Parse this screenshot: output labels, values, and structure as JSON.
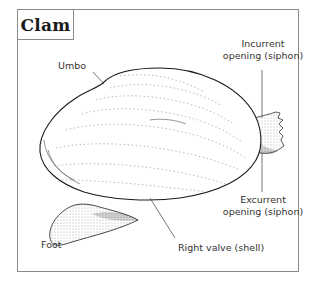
{
  "title": "Clam",
  "labels": {
    "umbo": "Umbo",
    "incurrent_line1": "Incurrent",
    "incurrent_line2": "opening (siphon)",
    "excurrent_line1": "Excurrent",
    "excurrent_line2": "opening (siphon)",
    "foot": "Foot",
    "right_valve": "Right valve (shell)"
  },
  "colors": {
    "outline": "#1a1a1a",
    "leader_line": "#555555",
    "frame": "#8a8a8a",
    "stipple": "#9a9a9a"
  }
}
